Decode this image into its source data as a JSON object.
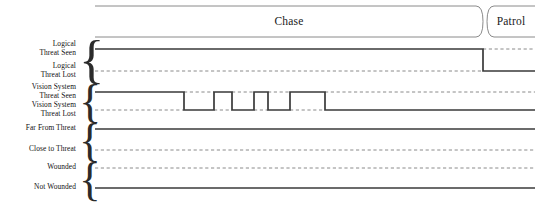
{
  "diagram": {
    "kind": "timing-diagram",
    "width": 542,
    "height": 206,
    "time_axis": {
      "x_start": 95,
      "x_end": 535
    },
    "colors": {
      "signal_high": "#3a3a3a",
      "signal_low": "#8a8a8a",
      "state_border": "#7d7d7d",
      "text": "#1a1a1a"
    }
  },
  "state_track": {
    "states": [
      {
        "label": "Chase",
        "x_start": 95,
        "x_end": 483
      },
      {
        "label": "Patrol",
        "x_start": 487,
        "x_end": 535
      }
    ]
  },
  "signals": [
    {
      "id": "logical-threat",
      "high_label_line1": "Logical",
      "high_label_line2": "Threat Seen",
      "low_label_line1": "Logical",
      "low_label_line2": "Threat Lost",
      "high_y": 49,
      "low_y": 71,
      "brace_top": 38,
      "brace_bottom": 80,
      "initial": "high",
      "transitions": [
        {
          "x": 483,
          "to": "low"
        }
      ]
    },
    {
      "id": "vision-system-threat",
      "high_label_line1": "Vision System",
      "high_label_line2": "Threat Seen",
      "low_label_line1": "Vision System",
      "low_label_line2": "Threat Lost",
      "high_y": 92,
      "low_y": 110,
      "brace_top": 83,
      "brace_bottom": 120,
      "initial": "high",
      "transitions": [
        {
          "x": 184,
          "to": "low"
        },
        {
          "x": 214,
          "to": "high"
        },
        {
          "x": 232,
          "to": "low"
        },
        {
          "x": 254,
          "to": "high"
        },
        {
          "x": 268,
          "to": "low"
        },
        {
          "x": 290,
          "to": "high"
        },
        {
          "x": 325,
          "to": "low"
        }
      ]
    },
    {
      "id": "threat-distance",
      "high_label_line1": "",
      "high_label_line2": "Far From Threat",
      "low_label_line1": "",
      "low_label_line2": "Close to Threat",
      "high_y": 129,
      "low_y": 150,
      "brace_top": 124,
      "brace_bottom": 160,
      "initial": "high",
      "transitions": []
    },
    {
      "id": "wounded-state",
      "high_label_line1": "",
      "high_label_line2": "Wounded",
      "low_label_line1": "",
      "low_label_line2": "Not Wounded",
      "high_y": 168,
      "low_y": 188,
      "brace_top": 163,
      "brace_bottom": 199,
      "initial": "low",
      "transitions": []
    }
  ]
}
